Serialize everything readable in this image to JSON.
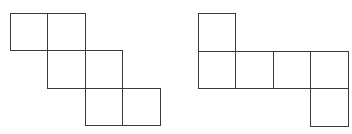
{
  "diagram": {
    "type": "cube-nets",
    "stroke_color": "#3a3a3a",
    "background": "#ffffff",
    "cell_size": 37.5,
    "figures": [
      {
        "name": "net-left",
        "origin": [
          9.5,
          12.5
        ],
        "cells": [
          [
            0,
            0
          ],
          [
            1,
            0
          ],
          [
            1,
            1
          ],
          [
            2,
            1
          ],
          [
            2,
            2
          ],
          [
            3,
            2
          ]
        ]
      },
      {
        "name": "net-right",
        "origin": [
          197.5,
          13.0
        ],
        "cells": [
          [
            0,
            0
          ],
          [
            0,
            1
          ],
          [
            1,
            1
          ],
          [
            2,
            1
          ],
          [
            3,
            1
          ],
          [
            3,
            2
          ]
        ]
      }
    ]
  }
}
